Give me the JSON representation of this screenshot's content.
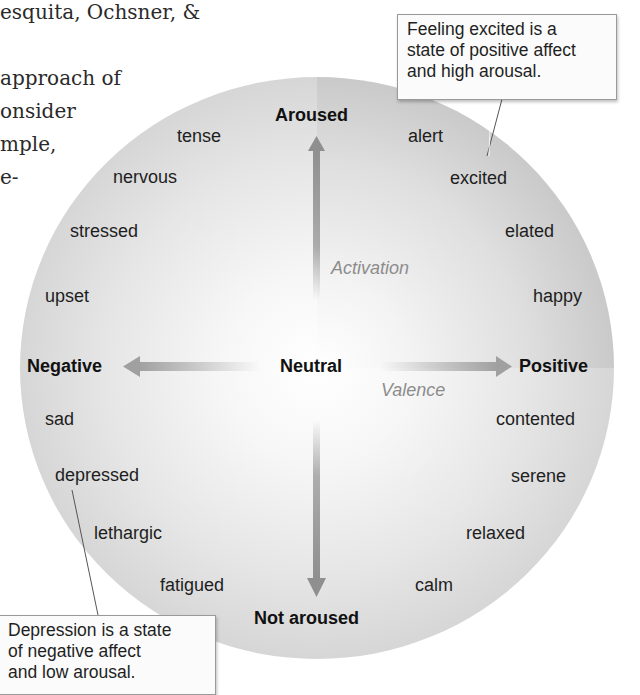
{
  "body_text": {
    "lines": [
      "esquita, Ochsner, &",
      "approach of",
      "onsider",
      "mple,",
      "e-"
    ]
  },
  "diagram": {
    "axes": {
      "vertical": {
        "name": "Activation",
        "top": "Aroused",
        "bottom": "Not aroused"
      },
      "horizontal": {
        "name": "Valence",
        "left": "Negative",
        "right": "Positive"
      },
      "center": "Neutral"
    },
    "quadrants": {
      "top_left": [
        "tense",
        "nervous",
        "stressed",
        "upset"
      ],
      "top_right": [
        "alert",
        "excited",
        "elated",
        "happy"
      ],
      "bottom_left": [
        "sad",
        "depressed",
        "lethargic",
        "fatigued"
      ],
      "bottom_right": [
        "contented",
        "serene",
        "relaxed",
        "calm"
      ]
    },
    "callouts": {
      "excited": [
        "Feeling excited is a",
        "state of positive affect",
        "and high arousal."
      ],
      "depressed": [
        "Depression is a state",
        "of negative affect",
        "and low arousal."
      ]
    },
    "colors": {
      "arrow": "#8f8f8f",
      "axis_name": "#8c8c8c",
      "circle_edge": "#c2c2c2"
    }
  }
}
